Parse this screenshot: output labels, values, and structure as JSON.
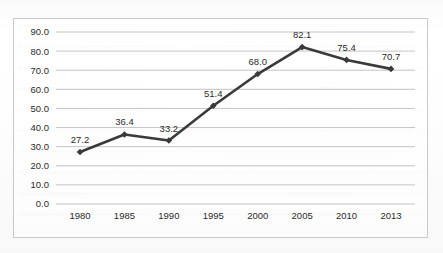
{
  "chart_data": {
    "type": "line",
    "title": "",
    "subtitle": "",
    "xlabel": "",
    "ylabel": "",
    "categories": [
      "1980",
      "1985",
      "1990",
      "1995",
      "2000",
      "2005",
      "2010",
      "2013"
    ],
    "values": [
      27.2,
      36.4,
      33.2,
      51.4,
      68.0,
      82.1,
      75.4,
      70.7
    ],
    "point_labels": [
      "27.2",
      "36.4",
      "33.2",
      "51.4",
      "68.0",
      "82.1",
      "75.4",
      "70.7"
    ],
    "ylim": [
      0,
      90
    ],
    "ytick_labels": [
      "90.0",
      "80.0",
      "70.0",
      "60.0",
      "50.0",
      "40.0",
      "30.0",
      "20.0",
      "10.0",
      "0.0"
    ],
    "ytick_values": [
      90,
      80,
      70,
      60,
      50,
      40,
      30,
      20,
      10,
      0
    ],
    "grid": "horizontal",
    "legend": "none",
    "series": [
      {
        "name": "",
        "values": [
          27.2,
          36.4,
          33.2,
          51.4,
          68.0,
          82.1,
          75.4,
          70.7
        ],
        "color": "#3a3a3a",
        "marker": "diamond",
        "data_labels": true
      }
    ],
    "colors": {
      "line": "#3a3a3a",
      "marker": "#3a3a3a",
      "gridline": "#bdbdbd",
      "border": "#c9c9c9",
      "text": "#2b2b2b",
      "background": "#fcfcfc"
    }
  }
}
